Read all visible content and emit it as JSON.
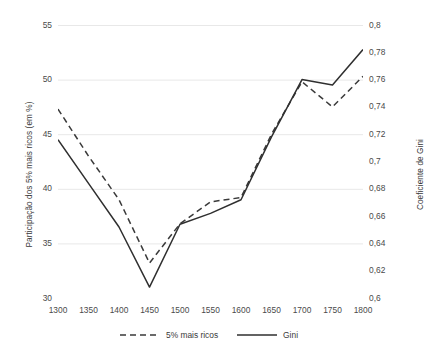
{
  "chart_data": {
    "type": "line",
    "title": "",
    "subtitle": "",
    "xlabel": "",
    "ylabel": "Participação dos 5% mais ricos (em %)",
    "y2label": "Coeficiente de Gini",
    "grid": true,
    "grid_axis": "y",
    "legend_position": "bottom",
    "x": [
      1300,
      1350,
      1400,
      1450,
      1500,
      1550,
      1600,
      1650,
      1700,
      1750,
      1800
    ],
    "xticklabels": [
      "1300",
      "1350",
      "1400",
      "1450",
      "1500",
      "1550",
      "1600",
      "1650",
      "1700",
      "1750",
      "1800"
    ],
    "xlim": [
      1300,
      1800
    ],
    "ylim": [
      30,
      55
    ],
    "yticks": [
      30,
      35,
      40,
      45,
      50,
      55
    ],
    "yticklabels": [
      "30",
      "35",
      "40",
      "45",
      "50",
      "55"
    ],
    "y2lim": [
      0.6,
      0.8
    ],
    "y2ticks": [
      0.6,
      0.62,
      0.64,
      0.66,
      0.68,
      0.7,
      0.72,
      0.74,
      0.76,
      0.78,
      0.8
    ],
    "y2ticklabels": [
      "0,6",
      "0,62",
      "0,64",
      "0,66",
      "0,68",
      "0,7",
      "0,72",
      "0,74",
      "0,76",
      "0,78",
      "0,8"
    ],
    "series": [
      {
        "name": "5% mais ricos",
        "axis": "left",
        "style": "dashed",
        "color": "#3a3a3a",
        "values": [
          47.3,
          43.0,
          39.0,
          33.2,
          36.8,
          38.8,
          39.2,
          45.0,
          49.8,
          47.5,
          50.3
        ]
      },
      {
        "name": "Gini",
        "axis": "right",
        "style": "solid",
        "color": "#2f2f2f",
        "values": [
          0.716,
          0.684,
          0.652,
          0.608,
          0.654,
          0.662,
          0.672,
          0.718,
          0.76,
          0.756,
          0.782
        ]
      }
    ]
  },
  "axes": {
    "left_title": "Participação dos 5% mais ricos (em %)",
    "right_title": "Coeficiente de Gini"
  },
  "legend": {
    "items": [
      {
        "label": "5% mais ricos",
        "style": "dashed"
      },
      {
        "label": "Gini",
        "style": "solid"
      }
    ]
  },
  "colors": {
    "line": "#2f2f2f",
    "grid": "#e8e8e8",
    "text": "#3f3f3f",
    "background": "#ffffff"
  }
}
